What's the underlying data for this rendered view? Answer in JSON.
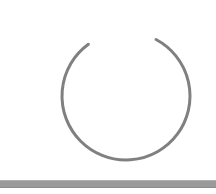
{
  "page": {
    "title": "Loading",
    "background_color": "#ffffff",
    "width": 216,
    "height": 194
  },
  "spinner": {
    "icon_name": "loading-spinner-icon",
    "status_text": "Loading",
    "color": "#808080",
    "stroke_width": 3,
    "center_x": 126,
    "center_y": 96,
    "radius": 64,
    "start_angle_deg": -62,
    "sweep_deg": 296,
    "gap_deg": 64
  },
  "bottom_bar": {
    "name": "bottom-status-bar",
    "color": "#9a9a9a",
    "highlight_color": "#b0b0b0",
    "shadow_color": "#8c8c8c",
    "top": 180,
    "height": 8,
    "label": ""
  }
}
